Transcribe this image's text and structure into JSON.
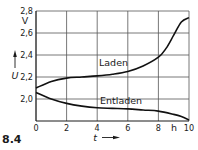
{
  "chart_data": {
    "type": "line",
    "title": "",
    "figure_label": "8.4",
    "xlabel": "t",
    "xunit": "h",
    "ylabel": "U",
    "yunit": "V",
    "xlim": [
      0,
      10
    ],
    "ylim": [
      1.8,
      2.8
    ],
    "xticks": [
      0,
      2,
      4,
      6,
      8,
      10
    ],
    "xtick_labels": [
      "0",
      "2",
      "4",
      "6",
      "8",
      "10"
    ],
    "yticks": [
      2.0,
      2.2,
      2.4,
      2.6,
      2.8
    ],
    "ytick_labels": [
      "2,0",
      "2,2",
      "2,4",
      "2,6",
      "2,8"
    ],
    "grid": true,
    "legend": "none (inline curve labels)",
    "series": [
      {
        "name": "Laden",
        "x": [
          0,
          1,
          2,
          3,
          4,
          5,
          6,
          7,
          8,
          8.5,
          9,
          9.5,
          10
        ],
        "values": [
          2.1,
          2.16,
          2.19,
          2.2,
          2.21,
          2.225,
          2.25,
          2.3,
          2.38,
          2.46,
          2.58,
          2.7,
          2.74
        ]
      },
      {
        "name": "Entladen",
        "x": [
          0,
          1,
          2,
          3,
          4,
          5,
          6,
          7,
          8,
          9,
          9.5,
          10
        ],
        "values": [
          2.06,
          2.0,
          1.96,
          1.935,
          1.92,
          1.915,
          1.91,
          1.9,
          1.89,
          1.86,
          1.84,
          1.81
        ]
      }
    ],
    "annotations": [
      {
        "text": "Laden",
        "x": 5.0,
        "y": 2.27
      },
      {
        "text": "Entladen",
        "x": 5.0,
        "y": 1.96
      }
    ]
  },
  "labels": {
    "figure": "8.4",
    "y_symbol": "U",
    "y_unit": "V",
    "x_symbol": "t",
    "x_unit": "h",
    "series_laden": "Laden",
    "series_entladen": "Entladen"
  }
}
